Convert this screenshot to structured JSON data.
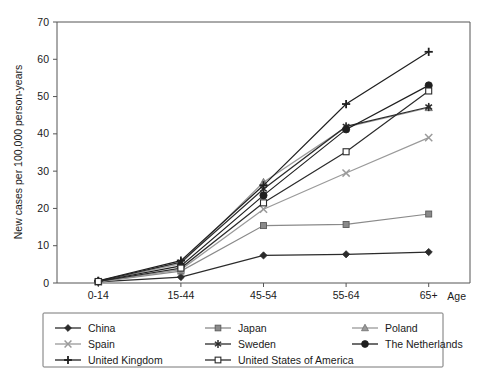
{
  "chart_data": {
    "type": "line",
    "title": "",
    "xlabel": "Age",
    "ylabel": "New cases per 100,000 person-years",
    "categories": [
      "0-14",
      "15-44",
      "45-54",
      "55-64",
      "65+"
    ],
    "ylim": [
      0,
      70
    ],
    "yticks": [
      0,
      10,
      20,
      30,
      40,
      50,
      60,
      70
    ],
    "grid": false,
    "legend_position": "bottom",
    "series": [
      {
        "name": "China",
        "marker": "filled-diamond",
        "color": "#2b2b2b",
        "values": [
          0.3,
          1.6,
          7.4,
          7.7,
          8.3
        ]
      },
      {
        "name": "Japan",
        "marker": "filled-square",
        "color": "#8a8a8a",
        "values": [
          0.3,
          3.2,
          15.4,
          15.7,
          18.5
        ]
      },
      {
        "name": "Poland",
        "marker": "filled-triangle",
        "color": "#9a9a9a",
        "values": [
          0.4,
          5.2,
          27.0,
          41.8,
          47.0
        ]
      },
      {
        "name": "Spain",
        "marker": "cross-x",
        "color": "#9a9a9a",
        "values": [
          0.3,
          3.6,
          19.8,
          29.5,
          39.0
        ]
      },
      {
        "name": "Sweden",
        "marker": "asterisk",
        "color": "#2b2b2b",
        "values": [
          0.5,
          5.6,
          25.2,
          42.0,
          47.2
        ]
      },
      {
        "name": "The Netherlands",
        "marker": "filled-circle",
        "color": "#1f1f1f",
        "values": [
          0.4,
          4.6,
          23.5,
          41.2,
          53.0
        ]
      },
      {
        "name": "United Kingdom",
        "marker": "plus",
        "color": "#1f1f1f",
        "values": [
          0.6,
          6.0,
          26.2,
          48.0,
          62.0
        ]
      },
      {
        "name": "United States of America",
        "marker": "open-square",
        "color": "#2b2b2b",
        "values": [
          0.4,
          4.0,
          21.5,
          35.2,
          51.5
        ]
      }
    ]
  },
  "legend": {
    "columns": 3,
    "entries": [
      {
        "label": "China"
      },
      {
        "label": "Japan"
      },
      {
        "label": "Poland"
      },
      {
        "label": "Spain"
      },
      {
        "label": "Sweden"
      },
      {
        "label": "The Netherlands"
      },
      {
        "label": "United Kingdom"
      },
      {
        "label": "United States of America"
      }
    ]
  }
}
